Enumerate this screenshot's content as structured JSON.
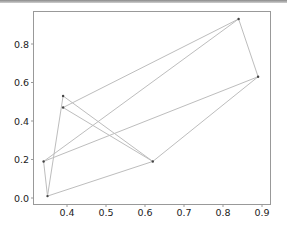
{
  "chart_data": {
    "type": "line",
    "title": "",
    "xlabel": "",
    "ylabel": "",
    "xlim": [
      0.33,
      0.9
    ],
    "ylim": [
      -0.02,
      0.96
    ],
    "grid": false,
    "legend": null,
    "x_ticks": [
      "0.4",
      "0.5",
      "0.6",
      "0.7",
      "0.8",
      "0.9"
    ],
    "y_ticks": [
      "0.0",
      "0.2",
      "0.4",
      "0.6",
      "0.8"
    ],
    "points": {
      "A": {
        "x": 0.39,
        "y": 0.53
      },
      "B": {
        "x": 0.39,
        "y": 0.47
      },
      "C": {
        "x": 0.62,
        "y": 0.19
      },
      "D": {
        "x": 0.84,
        "y": 0.93
      },
      "E": {
        "x": 0.89,
        "y": 0.63
      },
      "F": {
        "x": 0.34,
        "y": 0.19
      },
      "G": {
        "x": 0.35,
        "y": 0.01
      }
    },
    "edges": [
      [
        "G",
        "A"
      ],
      [
        "A",
        "C"
      ],
      [
        "C",
        "B"
      ],
      [
        "B",
        "D"
      ],
      [
        "D",
        "E"
      ],
      [
        "E",
        "C"
      ],
      [
        "C",
        "G"
      ],
      [
        "G",
        "F"
      ],
      [
        "F",
        "D"
      ],
      [
        "F",
        "E"
      ]
    ],
    "line_color": "#bdbdbd",
    "marker_color": "#444444"
  }
}
